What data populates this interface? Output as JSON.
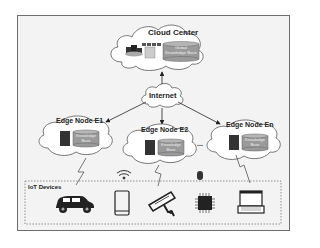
{
  "diagram": {
    "cloud_center": {
      "label": "Cloud Center",
      "kb_label": "Global Knowledge Base"
    },
    "internet": {
      "label": "Internet"
    },
    "edge_nodes": [
      {
        "label": "Edge Node E1",
        "kb_label": "Knowledge Base"
      },
      {
        "label": "Edge Node E2",
        "kb_label": "Knowledge Base"
      },
      {
        "label": "Edge Node En",
        "kb_label": "Knowledge Base"
      }
    ],
    "ellipsis": "...",
    "iot": {
      "label": "IoT Devices",
      "devices": [
        "car-icon",
        "smartphone-icon",
        "camera-icon",
        "chip-icon",
        "laptop-icon"
      ],
      "links": [
        "lightning-icon",
        "wifi-icon",
        "lightning-icon",
        "bluetooth-icon",
        "lightning-icon"
      ]
    },
    "colors": {
      "frame_bg": "#f3f3f3",
      "frame_border": "#6e6e6e",
      "cloud_fill": "#ffffff",
      "cloud_stroke": "#555555",
      "db_fill": "#9a9a9a",
      "server_fill": "#333333",
      "icon": "#333333"
    }
  }
}
